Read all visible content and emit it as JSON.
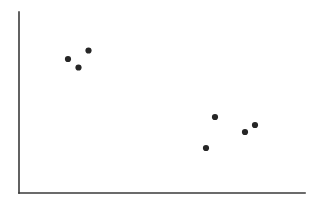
{
  "figure": {
    "background_color": "#ffffff",
    "width": 322,
    "height": 203
  },
  "axes": {
    "line_color": "#3a3a3a",
    "line_width": 1.6,
    "y_axis": {
      "x": 19,
      "y_top": 12,
      "y_bottom": 193
    },
    "x_axis": {
      "y": 193,
      "x_left": 19,
      "x_right": 305
    }
  },
  "marker": {
    "color": "#262626",
    "radius": 3.1,
    "shape": "circle"
  },
  "chart_data": {
    "type": "scatter",
    "title": "",
    "subtitle": "",
    "xlabel": "",
    "ylabel": "",
    "xlim": [
      0,
      1
    ],
    "ylim": [
      0,
      1
    ],
    "grid": false,
    "legend": false,
    "legend_position": "none",
    "xticks": [],
    "yticks": [],
    "xticklabels": [],
    "yticklabels": [],
    "annotations": [],
    "series": [
      {
        "name": "points",
        "marker": "circle",
        "color": "#262626",
        "x": [
          0.171,
          0.208,
          0.243,
          0.653,
          0.685,
          0.79,
          0.825
        ],
        "y": [
          0.74,
          0.693,
          0.787,
          0.249,
          0.42,
          0.337,
          0.376
        ],
        "pixels": [
          {
            "cx": 68.0,
            "cy": 59.0
          },
          {
            "cx": 78.5,
            "cy": 67.5
          },
          {
            "cx": 88.5,
            "cy": 50.5
          },
          {
            "cx": 206.0,
            "cy": 148.0
          },
          {
            "cx": 215.0,
            "cy": 117.0
          },
          {
            "cx": 245.0,
            "cy": 132.0
          },
          {
            "cx": 255.0,
            "cy": 125.0
          }
        ]
      }
    ],
    "point_count": 7
  }
}
